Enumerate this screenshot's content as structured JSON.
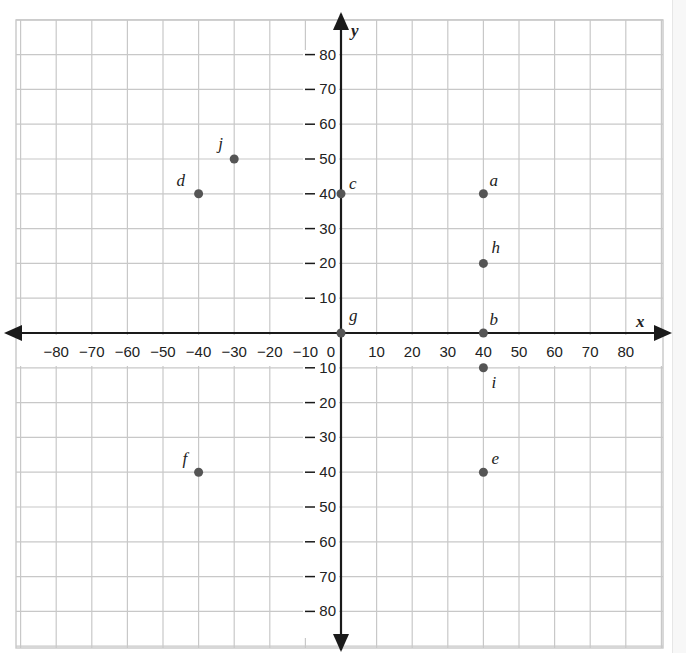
{
  "chart_data": {
    "type": "scatter",
    "title": "",
    "xlabel": "x",
    "ylabel": "y",
    "xlim": [
      -90,
      90
    ],
    "ylim": [
      -90,
      90
    ],
    "grid": true,
    "grid_step": 10,
    "x_ticks": [
      -80,
      -70,
      -60,
      -50,
      -40,
      -30,
      -20,
      -10,
      0,
      10,
      20,
      30,
      40,
      50,
      60,
      70,
      80
    ],
    "y_ticks": [
      80,
      70,
      60,
      50,
      40,
      30,
      20,
      10,
      -10,
      -20,
      -30,
      -40,
      -50,
      -60,
      -70,
      -80
    ],
    "points": [
      {
        "label": "a",
        "x": 40,
        "y": 40
      },
      {
        "label": "b",
        "x": 40,
        "y": 0
      },
      {
        "label": "c",
        "x": 0,
        "y": 40
      },
      {
        "label": "d",
        "x": -40,
        "y": 40
      },
      {
        "label": "e",
        "x": 40,
        "y": -40
      },
      {
        "label": "f",
        "x": -40,
        "y": -40
      },
      {
        "label": "g",
        "x": 0,
        "y": 0
      },
      {
        "label": "h",
        "x": 40,
        "y": 20
      },
      {
        "label": "i",
        "x": 40,
        "y": -10
      },
      {
        "label": "j",
        "x": -30,
        "y": 50
      }
    ]
  },
  "colors": {
    "grid": "#c8c8c8",
    "axis": "#1a1a1a",
    "point": "#555555",
    "text": "#222222"
  }
}
